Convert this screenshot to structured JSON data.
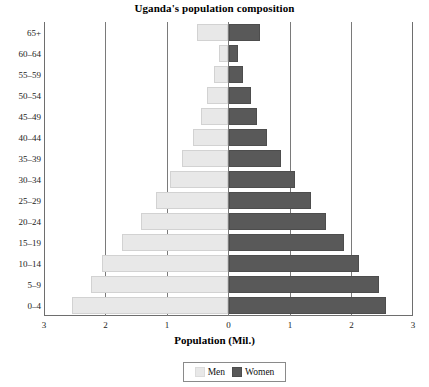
{
  "chart_data": {
    "type": "bar",
    "subtype": "population-pyramid",
    "title": "Uganda's population composition",
    "xlabel": "Population (Mil.)",
    "ylabel": "",
    "categories": [
      "0-4",
      "5-9",
      "10-14",
      "15-19",
      "20-24",
      "25-29",
      "30-34",
      "35-39",
      "40-44",
      "45-49",
      "50-54",
      "55-59",
      "60-64",
      "65+"
    ],
    "category_order_top_to_bottom": [
      "65+",
      "60-64",
      "55-59",
      "50-54",
      "45-49",
      "40-44",
      "35-39",
      "30-34",
      "25-29",
      "20-24",
      "15-19",
      "10-14",
      "5-9",
      "0-4"
    ],
    "series": [
      {
        "name": "Men",
        "direction": "left",
        "color": "#e8e8e8",
        "values": [
          2.55,
          2.23,
          2.06,
          1.73,
          1.43,
          1.18,
          0.95,
          0.76,
          0.57,
          0.44,
          0.35,
          0.24,
          0.16,
          0.52
        ]
      },
      {
        "name": "Women",
        "direction": "right",
        "color": "#595959",
        "values": [
          2.56,
          2.45,
          2.13,
          1.87,
          1.59,
          1.34,
          1.08,
          0.85,
          0.63,
          0.47,
          0.36,
          0.24,
          0.16,
          0.52
        ]
      }
    ],
    "xticks": [
      "3",
      "2",
      "1",
      "0",
      "1",
      "2",
      "3"
    ],
    "xtick_values": [
      -3,
      -2,
      -1,
      0,
      1,
      2,
      3
    ],
    "xlim": [
      -3,
      3
    ],
    "grid": true,
    "grid_axis": "x",
    "legend": {
      "position": "bottom-center",
      "entries": [
        {
          "label": "Men",
          "color": "#e8e8e8"
        },
        {
          "label": "Women",
          "color": "#595959"
        }
      ]
    }
  }
}
